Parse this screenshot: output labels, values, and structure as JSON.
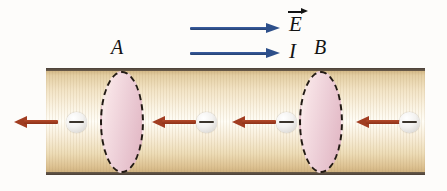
{
  "figure": {
    "width": 447,
    "height": 191
  },
  "conductor": {
    "name": "cylindrical-conductor",
    "fill_color": "#f6eacb",
    "edge_color": "#4a4038",
    "left": 46,
    "top": 68,
    "width": 379,
    "height": 107
  },
  "cross_sections": [
    {
      "label": "A",
      "name": "cross-section-a",
      "left": 100,
      "top": 71,
      "width": 44,
      "height": 102,
      "fill_color": "#ecccd6",
      "outline_style": "dashed",
      "outline_color": "#221a14"
    },
    {
      "label": "B",
      "name": "cross-section-b",
      "left": 299,
      "top": 71,
      "width": 44,
      "height": 102,
      "fill_color": "#ecccd6",
      "outline_style": "dashed",
      "outline_color": "#221a14"
    }
  ],
  "field_arrows": [
    {
      "label": "E",
      "name": "electric-field-arrow",
      "vector": true,
      "color": "#2d4f8a",
      "direction": "right",
      "left": 190,
      "top": 23,
      "length": 90
    },
    {
      "label": "I",
      "name": "current-arrow",
      "vector": false,
      "color": "#2d4f8a",
      "direction": "right",
      "left": 190,
      "top": 48,
      "length": 90
    }
  ],
  "drift_arrows": {
    "name": "electron-drift-arrow",
    "color": "#a13d21",
    "direction": "left",
    "count": 4,
    "items": [
      {
        "left": 14,
        "top": 116,
        "length": 44
      },
      {
        "left": 152,
        "top": 116,
        "length": 44
      },
      {
        "left": 232,
        "top": 116,
        "length": 44
      },
      {
        "left": 356,
        "top": 116,
        "length": 44
      }
    ]
  },
  "electrons": {
    "name": "electron",
    "charge_symbol": "−",
    "fill_color": "#f1efec",
    "sign_color": "#3a342c",
    "count": 4,
    "items": [
      {
        "left": 66,
        "top": 112
      },
      {
        "left": 196,
        "top": 112
      },
      {
        "left": 276,
        "top": 112
      },
      {
        "left": 399,
        "top": 112
      }
    ]
  }
}
